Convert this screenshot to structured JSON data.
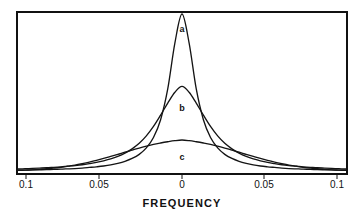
{
  "figure": {
    "background_color": "#ffffff",
    "frame_color": "#111111",
    "curve_color": "#141414"
  },
  "axis_title": "FREQUENCY",
  "tick_labels": [
    "0.1",
    "0.05",
    "0",
    "0.05",
    "0.1"
  ],
  "curve_labels": [
    "a",
    "b",
    "c"
  ],
  "chart_data": {
    "type": "line",
    "title": "",
    "subtitle": "",
    "xlabel": "FREQUENCY",
    "ylabel": "",
    "xlim": [
      -0.115,
      0.115
    ],
    "ylim": [
      0,
      1
    ],
    "grid": false,
    "legend": "inline-curve-labels",
    "x_ticks": [
      -0.1,
      -0.05,
      0,
      0.05,
      0.1
    ],
    "x_tick_labels": [
      "0.1",
      "0.05",
      "0",
      "0.05",
      "0.1"
    ],
    "y_ticks": [],
    "y_tick_labels": [],
    "annotations": [
      {
        "text": "a",
        "x": 0.0,
        "y": 0.88,
        "note": "label for tallest narrowest peak"
      },
      {
        "text": "b",
        "x": 0.0,
        "y": 0.47,
        "note": "label for medium intermediate peak"
      },
      {
        "text": "c",
        "x": 0.0,
        "y": 0.17,
        "note": "label for broad low peak"
      }
    ],
    "x": [
      -0.115,
      -0.11,
      -0.105,
      -0.1,
      -0.095,
      -0.09,
      -0.085,
      -0.08,
      -0.075,
      -0.07,
      -0.065,
      -0.06,
      -0.055,
      -0.05,
      -0.045,
      -0.04,
      -0.035,
      -0.03,
      -0.025,
      -0.02,
      -0.015,
      -0.01,
      -0.005,
      0,
      0.005,
      0.01,
      0.015,
      0.02,
      0.025,
      0.03,
      0.035,
      0.04,
      0.045,
      0.05,
      0.055,
      0.06,
      0.065,
      0.07,
      0.075,
      0.08,
      0.085,
      0.09,
      0.095,
      0.1,
      0.105,
      0.11,
      0.115
    ],
    "series": [
      {
        "name": "a",
        "shape": "lorentzian",
        "peak_value": 1.0,
        "half_width_half_max": 0.0105,
        "values": [
          0.008,
          0.009,
          0.01,
          0.011,
          0.012,
          0.014,
          0.015,
          0.017,
          0.019,
          0.022,
          0.026,
          0.03,
          0.035,
          0.042,
          0.052,
          0.065,
          0.083,
          0.109,
          0.15,
          0.216,
          0.329,
          0.524,
          0.815,
          1.0,
          0.815,
          0.524,
          0.329,
          0.216,
          0.15,
          0.109,
          0.083,
          0.065,
          0.052,
          0.042,
          0.035,
          0.03,
          0.026,
          0.022,
          0.019,
          0.017,
          0.015,
          0.014,
          0.012,
          0.011,
          0.01,
          0.009,
          0.008
        ]
      },
      {
        "name": "b",
        "shape": "lorentzian",
        "peak_value": 0.54,
        "half_width_half_max": 0.0205,
        "values": [
          0.016,
          0.018,
          0.02,
          0.022,
          0.024,
          0.027,
          0.03,
          0.034,
          0.038,
          0.043,
          0.05,
          0.058,
          0.068,
          0.08,
          0.096,
          0.117,
          0.144,
          0.179,
          0.226,
          0.286,
          0.358,
          0.434,
          0.503,
          0.54,
          0.503,
          0.434,
          0.358,
          0.286,
          0.226,
          0.179,
          0.144,
          0.117,
          0.096,
          0.08,
          0.068,
          0.058,
          0.05,
          0.043,
          0.038,
          0.034,
          0.03,
          0.027,
          0.024,
          0.022,
          0.02,
          0.018,
          0.016
        ]
      },
      {
        "name": "c",
        "shape": "gaussian",
        "peak_value": 0.2,
        "sigma": 0.033,
        "values": [
          0.007,
          0.009,
          0.011,
          0.014,
          0.018,
          0.022,
          0.027,
          0.034,
          0.041,
          0.05,
          0.06,
          0.071,
          0.083,
          0.096,
          0.109,
          0.123,
          0.136,
          0.149,
          0.161,
          0.172,
          0.181,
          0.189,
          0.196,
          0.2,
          0.196,
          0.189,
          0.181,
          0.172,
          0.161,
          0.149,
          0.136,
          0.123,
          0.109,
          0.096,
          0.083,
          0.071,
          0.06,
          0.05,
          0.041,
          0.034,
          0.027,
          0.022,
          0.018,
          0.014,
          0.011,
          0.009,
          0.007
        ]
      }
    ]
  }
}
